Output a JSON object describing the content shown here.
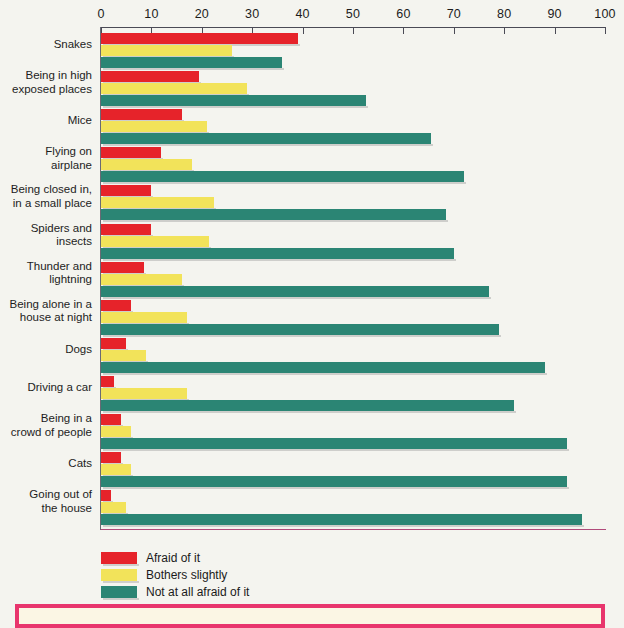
{
  "chart_data": {
    "type": "bar",
    "orientation": "horizontal",
    "title": "",
    "xlabel": "",
    "ylabel": "",
    "xlim": [
      0,
      100
    ],
    "xticks": [
      0,
      10,
      20,
      30,
      40,
      50,
      60,
      70,
      80,
      90,
      100
    ],
    "grid": false,
    "legend_position": "bottom-left",
    "categories": [
      "Snakes",
      "Being in high exposed places",
      "Mice",
      "Flying on airplane",
      "Being closed in, in a small place",
      "Spiders and insects",
      "Thunder and lightning",
      "Being alone in a house at night",
      "Dogs",
      "Driving a car",
      "Being in a crowd of people",
      "Cats",
      "Going out of the house"
    ],
    "series": [
      {
        "name": "Afraid of it",
        "color": "#e6232a",
        "values": [
          39,
          19.5,
          16,
          12,
          10,
          10,
          8.5,
          6,
          5,
          2.5,
          4,
          4,
          2
        ]
      },
      {
        "name": "Bothers slightly",
        "color": "#f2e35a",
        "values": [
          26,
          29,
          21,
          18,
          22.5,
          21.5,
          16,
          17,
          9,
          17,
          6,
          6,
          5
        ]
      },
      {
        "name": "Not at all afraid of it",
        "color": "#2b8574",
        "values": [
          36,
          52.5,
          65.5,
          72,
          68.5,
          70,
          77,
          79,
          88,
          82,
          92.5,
          92.5,
          95.5
        ]
      }
    ]
  },
  "axis": {
    "tick_labels": [
      "0",
      "10",
      "20",
      "30",
      "40",
      "50",
      "60",
      "70",
      "80",
      "90",
      "100"
    ]
  },
  "category_labels": [
    [
      "Snakes"
    ],
    [
      "Being in high",
      "exposed places"
    ],
    [
      "Mice"
    ],
    [
      "Flying on",
      "airplane"
    ],
    [
      "Being closed in,",
      "in a small place"
    ],
    [
      "Spiders and",
      "insects"
    ],
    [
      "Thunder and",
      "lightning"
    ],
    [
      "Being alone in a",
      "house at night"
    ],
    [
      "Dogs"
    ],
    [
      "Driving a car"
    ],
    [
      "Being in a",
      "crowd of people"
    ],
    [
      "Cats"
    ],
    [
      "Going out of",
      "the house"
    ]
  ],
  "legend": {
    "items": [
      {
        "label": "Afraid of it",
        "color": "#e6232a"
      },
      {
        "label": "Bothers slightly",
        "color": "#f2e35a"
      },
      {
        "label": "Not at all afraid of it",
        "color": "#2b8574"
      }
    ]
  },
  "callout": {
    "text": "",
    "border_color": "#e8356d",
    "background_color": "#fbf6e4"
  },
  "colors": {
    "background": "#f4f4ef",
    "axis": "#4a4a55",
    "baseline": "#b04a7a",
    "afraid": "#e6232a",
    "bothers": "#f2e35a",
    "not_afraid": "#2b8574"
  }
}
